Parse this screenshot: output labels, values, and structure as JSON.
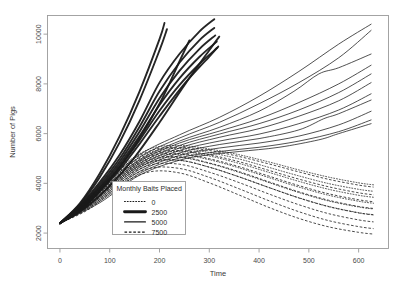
{
  "figure": {
    "title": "",
    "background": "#ffffff",
    "frame_color": "#9a9a9a",
    "line_color": "#1a1a1a"
  },
  "axes": {
    "x_title": "Time",
    "y_title": "Number of Pigs",
    "x_ticks": [
      "0",
      "100",
      "200",
      "300",
      "400",
      "500",
      "600"
    ],
    "y_ticks": [
      "2000",
      "4000",
      "6000",
      "8000",
      "10000"
    ]
  },
  "legend": {
    "title": "Monthly Baits Placed",
    "entries": [
      {
        "label": "0",
        "style": "dotted",
        "width": 1.0
      },
      {
        "label": "2500",
        "style": "solid-thick",
        "width": 2.6
      },
      {
        "label": "5000",
        "style": "solid",
        "width": 1.4
      },
      {
        "label": "7500",
        "style": "dashed",
        "width": 1.0
      }
    ]
  },
  "chart_data": {
    "type": "line",
    "title": "",
    "xlabel": "Time",
    "ylabel": "Number of Pigs",
    "xlim": [
      -25,
      660
    ],
    "ylim": [
      1380,
      10750
    ],
    "grid": false,
    "legend_position": "inside-lower-left",
    "legend_title": "Monthly Baits Placed",
    "x_ticks": [
      0,
      100,
      200,
      300,
      400,
      500,
      600
    ],
    "y_ticks": [
      2000,
      4000,
      6000,
      8000,
      10000
    ],
    "note": "Simulated pig-population trajectories under four monthly baiting levels. All replicates start near 2400 at Time 0 and fan out. Baiting 2500 and 5000 yield growth; 0 and 7500 curves peak near Time 180-220 then decline.",
    "series": [
      {
        "name": "0",
        "style": "dotted",
        "x": [
          0,
          60,
          120,
          180,
          240,
          300,
          360,
          420,
          480,
          540,
          600,
          630
        ],
        "values": [
          2400,
          3450,
          4620,
          5380,
          5520,
          5380,
          5150,
          4860,
          4540,
          4250,
          4020,
          3940
        ]
      },
      {
        "name": "0",
        "style": "dotted",
        "x": [
          0,
          60,
          120,
          180,
          240,
          300,
          360,
          420,
          480,
          540,
          600,
          630
        ],
        "values": [
          2400,
          3380,
          4500,
          5240,
          5400,
          5240,
          4980,
          4640,
          4300,
          3990,
          3760,
          3680
        ]
      },
      {
        "name": "0",
        "style": "dotted",
        "x": [
          0,
          60,
          120,
          180,
          240,
          300,
          360,
          420,
          480,
          540,
          600,
          630
        ],
        "values": [
          2400,
          3320,
          4410,
          5120,
          5280,
          5100,
          4800,
          4440,
          4080,
          3760,
          3520,
          3440
        ]
      },
      {
        "name": "0",
        "style": "dotted",
        "x": [
          0,
          60,
          120,
          180,
          240,
          300,
          360,
          420,
          480,
          540,
          600,
          630
        ],
        "values": [
          2400,
          3260,
          4330,
          5020,
          5160,
          4950,
          4620,
          4230,
          3850,
          3520,
          3280,
          3200
        ]
      },
      {
        "name": "0",
        "style": "dotted",
        "x": [
          0,
          60,
          120,
          180,
          240,
          300,
          360,
          420,
          480,
          540,
          600,
          630
        ],
        "values": [
          2400,
          3200,
          4250,
          4920,
          5040,
          4800,
          4440,
          4030,
          3630,
          3290,
          3050,
          2970
        ]
      },
      {
        "name": "0",
        "style": "dotted",
        "x": [
          0,
          60,
          120,
          180,
          240,
          300,
          360,
          420,
          480,
          540,
          600,
          630
        ],
        "values": [
          2400,
          3140,
          4170,
          4820,
          4920,
          4650,
          4260,
          3830,
          3420,
          3070,
          2820,
          2740
        ]
      },
      {
        "name": "2500",
        "style": "solid-thick",
        "x": [
          0,
          40,
          80,
          120,
          160,
          200,
          240,
          280,
          310
        ],
        "values": [
          2400,
          3100,
          4050,
          5150,
          6500,
          8050,
          9200,
          10100,
          10600
        ]
      },
      {
        "name": "2500",
        "style": "solid-thick",
        "x": [
          0,
          40,
          80,
          120,
          160,
          200,
          240,
          280,
          310
        ],
        "values": [
          2400,
          3050,
          3960,
          5000,
          6280,
          7700,
          8850,
          9750,
          10250
        ]
      },
      {
        "name": "2500",
        "style": "solid-thick",
        "x": [
          0,
          40,
          80,
          120,
          160,
          200,
          240,
          280,
          312
        ],
        "values": [
          2400,
          3000,
          3880,
          4880,
          6080,
          7420,
          8520,
          9400,
          9950
        ]
      },
      {
        "name": "2500",
        "style": "solid-thick",
        "x": [
          0,
          40,
          80,
          120,
          160,
          200,
          240,
          280,
          315
        ],
        "values": [
          2400,
          2960,
          3810,
          4770,
          5900,
          7150,
          8220,
          9080,
          9700
        ]
      },
      {
        "name": "2500",
        "style": "solid-thick",
        "x": [
          0,
          40,
          80,
          120,
          160,
          200,
          240,
          280,
          316
        ],
        "values": [
          2400,
          2920,
          3740,
          4660,
          5740,
          6920,
          7950,
          8800,
          9450
        ]
      },
      {
        "name": "2500",
        "style": "solid-thick",
        "x": [
          0,
          40,
          80,
          120,
          160,
          200,
          250,
          300,
          318
        ],
        "values": [
          2400,
          2880,
          3680,
          4560,
          5590,
          6700,
          8000,
          9100,
          9500
        ]
      },
      {
        "name": "2500",
        "style": "solid-thick",
        "x": [
          0,
          50,
          100,
          150,
          200,
          250,
          300,
          320
        ],
        "values": [
          2400,
          3000,
          3900,
          5050,
          6450,
          7950,
          9350,
          9900
        ]
      },
      {
        "name": "2500",
        "style": "solid-thick",
        "x": [
          0,
          50,
          100,
          150,
          200,
          240,
          260
        ],
        "values": [
          2400,
          3080,
          4150,
          5500,
          7200,
          8900,
          9750
        ]
      },
      {
        "name": "2500",
        "style": "solid-thick",
        "x": [
          0,
          40,
          80,
          120,
          160,
          200,
          215
        ],
        "values": [
          2400,
          3150,
          4250,
          5650,
          7350,
          9350,
          10200
        ]
      },
      {
        "name": "2500",
        "style": "solid-thick",
        "x": [
          0,
          40,
          80,
          120,
          160,
          200,
          210
        ],
        "values": [
          2400,
          3200,
          4400,
          5900,
          7700,
          9800,
          10450
        ]
      },
      {
        "name": "5000",
        "style": "solid",
        "x": [
          0,
          80,
          160,
          240,
          320,
          400,
          480,
          560,
          625
        ],
        "values": [
          2400,
          3850,
          5150,
          5950,
          6650,
          7500,
          8500,
          9600,
          10400
        ]
      },
      {
        "name": "5000",
        "style": "solid",
        "x": [
          0,
          80,
          160,
          240,
          320,
          400,
          480,
          560,
          625
        ],
        "values": [
          2400,
          3780,
          5050,
          5820,
          6450,
          7200,
          8050,
          9050,
          10150
        ]
      },
      {
        "name": "5000",
        "style": "solid",
        "x": [
          0,
          80,
          160,
          240,
          320,
          400,
          470,
          520,
          560,
          625
        ],
        "values": [
          2400,
          3700,
          4950,
          5700,
          6250,
          6900,
          7700,
          8400,
          8650,
          9200
        ]
      },
      {
        "name": "5000",
        "style": "solid",
        "x": [
          0,
          80,
          160,
          240,
          320,
          400,
          480,
          560,
          625
        ],
        "values": [
          2400,
          3640,
          4880,
          5620,
          6100,
          6600,
          7250,
          8000,
          8750
        ]
      },
      {
        "name": "5000",
        "style": "solid",
        "x": [
          0,
          80,
          160,
          240,
          320,
          400,
          480,
          560,
          625
        ],
        "values": [
          2400,
          3580,
          4800,
          5520,
          5980,
          6400,
          6950,
          7650,
          8400
        ]
      },
      {
        "name": "5000",
        "style": "solid",
        "x": [
          0,
          80,
          160,
          240,
          320,
          400,
          480,
          560,
          625
        ],
        "values": [
          2400,
          3520,
          4720,
          5420,
          5850,
          6200,
          6700,
          7320,
          8050
        ]
      },
      {
        "name": "5000",
        "style": "solid",
        "x": [
          0,
          80,
          160,
          240,
          320,
          400,
          480,
          560,
          625
        ],
        "values": [
          2400,
          3460,
          4640,
          5320,
          5700,
          5980,
          6400,
          6950,
          7600
        ]
      },
      {
        "name": "5000",
        "style": "solid",
        "x": [
          0,
          80,
          160,
          240,
          320,
          400,
          480,
          530,
          560,
          625
        ],
        "values": [
          2400,
          3400,
          4560,
          5220,
          5560,
          5800,
          6150,
          6600,
          6800,
          7350
        ]
      },
      {
        "name": "5000",
        "style": "solid",
        "x": [
          0,
          80,
          160,
          240,
          320,
          400,
          480,
          560,
          625
        ],
        "values": [
          2400,
          3340,
          4480,
          5120,
          5420,
          5620,
          5900,
          6350,
          6900
        ]
      },
      {
        "name": "5000",
        "style": "solid",
        "x": [
          0,
          80,
          160,
          240,
          320,
          400,
          480,
          560,
          625
        ],
        "values": [
          2400,
          3280,
          4400,
          5020,
          5280,
          5450,
          5700,
          6080,
          6550
        ]
      },
      {
        "name": "5000",
        "style": "solid",
        "x": [
          0,
          80,
          160,
          240,
          300,
          360,
          440,
          520,
          560,
          625
        ],
        "values": [
          2400,
          3220,
          4330,
          4930,
          5150,
          5280,
          5450,
          5750,
          6000,
          6400
        ]
      },
      {
        "name": "7500",
        "style": "dashed",
        "x": [
          0,
          60,
          120,
          180,
          240,
          300,
          360,
          420,
          480,
          540,
          600,
          630
        ],
        "values": [
          2400,
          3420,
          4560,
          5300,
          5450,
          5320,
          5080,
          4780,
          4460,
          4160,
          3930,
          3850
        ]
      },
      {
        "name": "7500",
        "style": "dashed",
        "x": [
          0,
          60,
          120,
          180,
          240,
          300,
          360,
          420,
          480,
          540,
          600,
          630
        ],
        "values": [
          2400,
          3350,
          4460,
          5180,
          5320,
          5150,
          4870,
          4520,
          4170,
          3860,
          3620,
          3540
        ]
      },
      {
        "name": "7500",
        "style": "dashed",
        "x": [
          0,
          60,
          120,
          180,
          240,
          300,
          360,
          420,
          480,
          540,
          600,
          630
        ],
        "values": [
          2400,
          3290,
          4380,
          5080,
          5200,
          4990,
          4670,
          4290,
          3910,
          3580,
          3340,
          3260
        ]
      },
      {
        "name": "7500",
        "style": "dashed",
        "x": [
          0,
          60,
          120,
          180,
          240,
          300,
          360,
          420,
          480,
          540,
          600,
          630
        ],
        "values": [
          2400,
          3230,
          4300,
          4970,
          5070,
          4820,
          4470,
          4060,
          3660,
          3320,
          3070,
          2990
        ]
      },
      {
        "name": "7500",
        "style": "dashed",
        "x": [
          0,
          60,
          120,
          180,
          240,
          300,
          360,
          420,
          480,
          540,
          600,
          630
        ],
        "values": [
          2400,
          3170,
          4210,
          4860,
          4930,
          4650,
          4260,
          3830,
          3410,
          3060,
          2810,
          2730
        ]
      },
      {
        "name": "7500",
        "style": "dashed",
        "x": [
          0,
          60,
          120,
          180,
          240,
          300,
          360,
          420,
          480,
          540,
          600,
          630
        ],
        "values": [
          2400,
          3100,
          4110,
          4730,
          4770,
          4450,
          4030,
          3570,
          3140,
          2780,
          2530,
          2450
        ]
      },
      {
        "name": "7500",
        "style": "dashed",
        "x": [
          0,
          60,
          120,
          180,
          240,
          300,
          360,
          420,
          480,
          540,
          600,
          630
        ],
        "values": [
          2400,
          3040,
          4020,
          4600,
          4600,
          4240,
          3780,
          3300,
          2860,
          2500,
          2260,
          2180
        ]
      },
      {
        "name": "7500",
        "style": "dashed",
        "x": [
          0,
          60,
          120,
          180,
          240,
          300,
          360,
          420,
          480,
          540,
          600,
          630
        ],
        "values": [
          2400,
          2980,
          3920,
          4460,
          4420,
          4020,
          3530,
          3030,
          2590,
          2250,
          2030,
          1960
        ]
      }
    ]
  }
}
